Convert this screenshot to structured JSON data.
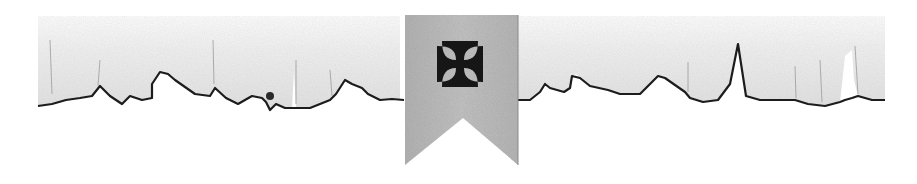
{
  "graphic": {
    "description": "Torn parchment divider with hanging banner",
    "banner": {
      "emblem": "cross-pattee-icon",
      "fill": "#b9b9b9",
      "emblem_color": "#161616"
    },
    "parchment": {
      "fill": "#ededed",
      "edge_color": "#1c1c1c"
    }
  }
}
